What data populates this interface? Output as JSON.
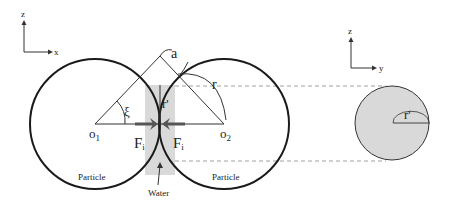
{
  "axes_left": {
    "vertical": "z",
    "horizontal": "x"
  },
  "axes_right": {
    "vertical": "z",
    "horizontal": "y"
  },
  "labels": {
    "a": "a",
    "r": "r",
    "r_prime": "r'",
    "xi": "ξ",
    "o1": "o",
    "o1_sub": "1",
    "o2": "o",
    "o2_sub": "2",
    "fi_left": "F",
    "fi_left_sub": "i",
    "fi_right": "F",
    "fi_right_sub": "i",
    "particle_left": "Particle",
    "particle_right": "Particle",
    "water": "Water",
    "r_prime_cross": "r'"
  },
  "colors": {
    "stroke": "#1a1a1a",
    "water_fill": "#d9d9d9",
    "force_arrow": "#555555",
    "dashed": "#888888"
  }
}
